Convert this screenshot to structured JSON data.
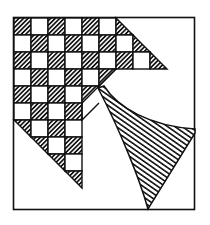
{
  "figure": {
    "colors": {
      "ink": "#111111",
      "background": "#ffffff"
    },
    "grid": {
      "origin_x": 14,
      "origin_y": 18,
      "cell": 17
    }
  }
}
